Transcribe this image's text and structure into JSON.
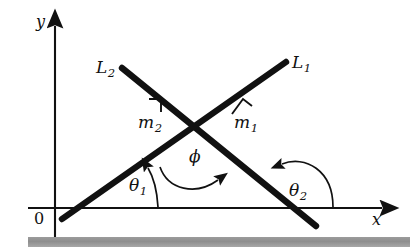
{
  "figure": {
    "background_color": "#ffffff",
    "ink_color": "#111111",
    "bar_color": "#939393"
  },
  "axes": {
    "x_label": "x",
    "y_label": "y",
    "origin_label": "0",
    "x_axis_name": "horizontal-axis",
    "y_axis_name": "vertical-axis"
  },
  "lines": [
    {
      "id": "L1",
      "label": "L",
      "subscript": "1",
      "slope_sign": "positive",
      "slope_label": "m",
      "slope_subscript": "1",
      "x1": 62,
      "y1": 219,
      "x2": 286,
      "y2": 62
    },
    {
      "id": "L2",
      "label": "L",
      "subscript": "2",
      "slope_sign": "negative",
      "slope_label": "m",
      "slope_subscript": "2",
      "x1": 122,
      "y1": 68,
      "x2": 316,
      "y2": 226
    }
  ],
  "intersection": {
    "x": 193,
    "y": 133
  },
  "angles": [
    {
      "name": "theta1",
      "symbol": "θ",
      "subscript": "1",
      "description": "inclination angle of L1 measured from positive x-axis"
    },
    {
      "name": "theta2",
      "symbol": "θ",
      "subscript": "2",
      "description": "inclination angle of L2 measured from positive x-axis"
    },
    {
      "name": "phi",
      "symbol": "ϕ",
      "subscript": "",
      "description": "angle from L1 to L2 at the intersection point"
    }
  ],
  "right_angle_marks": [
    {
      "name": "right-angle-mark-m1",
      "on_line": "L1"
    },
    {
      "name": "right-angle-mark-m2",
      "on_line": "L2"
    }
  ]
}
